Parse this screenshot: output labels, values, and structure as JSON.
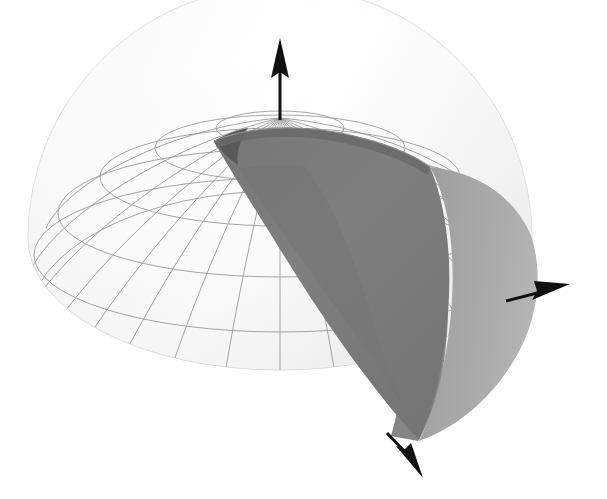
{
  "figure": {
    "title": "Hemispherical dome with conical cut-out and coordinate axes",
    "background_color": "#ffffff",
    "width": 607,
    "height": 499
  },
  "colors": {
    "dome_light": "#fcfcfc",
    "dome_shade": "#f0f0f0",
    "dome_edge": "#d8d8d8",
    "grid_stroke": "#9a9a9a",
    "grid_stroke_faint": "#bdbdbd",
    "cone_inner_dark": "#7d7d7d",
    "cone_inner_darkest": "#6e6e6e",
    "cone_outer_mid": "#8d8d8d",
    "cone_outer_light": "#a8a8a8",
    "cone_rim_shadow": "#5f5f5f",
    "axis_color": "#101010"
  },
  "surfaces": [
    {
      "name": "hemisphere-dome",
      "description": "Light gray wireframe-gridded hemispherical dome, opening downward",
      "shading": "very light, nearly white with soft gradient"
    },
    {
      "name": "cone-inner-surface",
      "description": "Dark gray interior of a cone whose apex sits near the dome pole and whose mouth opens toward lower front-right",
      "shading": "uniform medium-dark gray"
    },
    {
      "name": "cone-outer-surface",
      "description": "Mid gray outer flank of the cone visible on the right side of the figure",
      "shading": "medium gray with vertical gradient"
    }
  ],
  "grid": {
    "meridian_count": 24,
    "latitude_count": 6,
    "description": "Polar grid of meridians radiating from the pole and latitude circles drawn as ellipses"
  },
  "axes": [
    {
      "name": "z-axis",
      "label": "",
      "direction": "up",
      "tip": {
        "x": 280,
        "y": 40
      },
      "tail": {
        "x": 280,
        "y": 120
      },
      "arrow_style": "solid-filled-cone"
    },
    {
      "name": "y-axis",
      "label": "",
      "direction": "right-slightly-up",
      "tip": {
        "x": 568,
        "y": 285
      },
      "tail": {
        "x": 508,
        "y": 300
      },
      "arrow_style": "solid-filled-cone"
    },
    {
      "name": "x-axis",
      "label": "",
      "direction": "down-right-toward-viewer",
      "tip": {
        "x": 418,
        "y": 470
      },
      "tail": {
        "x": 388,
        "y": 434
      },
      "arrow_style": "solid-filled-cone"
    }
  ],
  "geometry": {
    "pole": {
      "x": 280,
      "y": 118
    },
    "dome_center": {
      "x": 280,
      "y": 238
    },
    "dome_radius_x": 252,
    "dome_radius_y": 132,
    "dome_bottom_y": 455,
    "dome_left_x": 28,
    "dome_right_x": 532,
    "cone_apex_bottom": {
      "x": 388,
      "y": 434
    },
    "cone_mouth_center": {
      "x": 352,
      "y": 205
    }
  }
}
